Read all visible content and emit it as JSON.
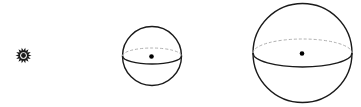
{
  "diagram": {
    "colors": {
      "outline": "#1a1a1a",
      "hidden_equator": "#b0b0b0",
      "center_dot": "#000000",
      "background": "#ffffff"
    },
    "figures": [
      {
        "id": "tiny-sphere",
        "kind": "starburst",
        "cx": 23.5,
        "cy": 55.5,
        "r": 8
      },
      {
        "id": "medium-sphere",
        "kind": "sphere",
        "cx": 152,
        "cy": 56,
        "r": 29.5,
        "equator_ry": 8
      },
      {
        "id": "large-sphere",
        "kind": "sphere",
        "cx": 302.5,
        "cy": 53,
        "r": 49.5,
        "equator_ry": 14
      }
    ]
  }
}
